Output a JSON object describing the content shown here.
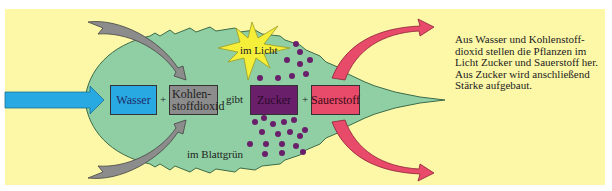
{
  "diagram": {
    "background_color": "#fdf8a8",
    "leaf_color": "#8fcfa3",
    "boxes": {
      "wasser": {
        "label": "Wasser",
        "color": "#29a9e1"
      },
      "kohlenstoffdioxid": {
        "line1": "Kohlen-",
        "line2": "stoffdioxid",
        "color": "#8c8c8c"
      },
      "zucker": {
        "label": "Zucker",
        "color": "#6a1f6a"
      },
      "sauerstoff": {
        "label": "Sauerstoff",
        "color": "#e84a6a"
      }
    },
    "operators": {
      "plus1": "+",
      "gibt": "gibt",
      "plus2": "+"
    },
    "light_label": "im Licht",
    "chlorophyll_label": "im Blattgrün",
    "caption_lines": [
      "Aus Wasser und Kohlenstoff-",
      "dioxid stellen die Pflanzen im",
      "Licht Zucker und Sauerstoff her.",
      "Aus Zucker wird anschließend",
      "Stärke aufgebaut."
    ]
  }
}
